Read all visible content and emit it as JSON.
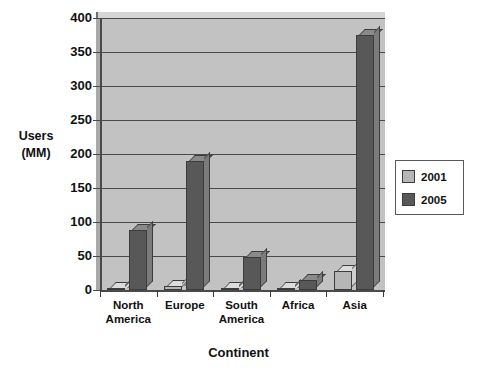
{
  "chart_data": {
    "type": "bar",
    "title": "",
    "xlabel": "Continent",
    "ylabel_lines": [
      "Users",
      "(MM)"
    ],
    "categories": [
      "North America",
      "Europe",
      "South America",
      "Africa",
      "Asia"
    ],
    "category_lines": [
      [
        "North",
        "America"
      ],
      [
        "Europe",
        ""
      ],
      [
        "South",
        "America"
      ],
      [
        "Africa",
        ""
      ],
      [
        "Asia",
        ""
      ]
    ],
    "series": [
      {
        "name": "2001",
        "color": "#b6b6b6",
        "values": [
          3,
          6,
          2,
          2,
          28
        ]
      },
      {
        "name": "2005",
        "color": "#585858",
        "values": [
          88,
          190,
          48,
          14,
          375
        ]
      }
    ],
    "ylim": [
      0,
      400
    ],
    "ytick_values": [
      0,
      50,
      100,
      150,
      200,
      250,
      300,
      350,
      400
    ],
    "ytick_labels": [
      "0",
      "50",
      "100",
      "150",
      "200",
      "250",
      "300",
      "350",
      "400"
    ],
    "grid": true,
    "legend_position": "right",
    "plot_background": "#c2c2c2",
    "axis_color": "#4a4a4a"
  },
  "legend": {
    "entries": [
      {
        "label": "2001",
        "color": "#b6b6b6"
      },
      {
        "label": "2005",
        "color": "#585858"
      }
    ]
  }
}
